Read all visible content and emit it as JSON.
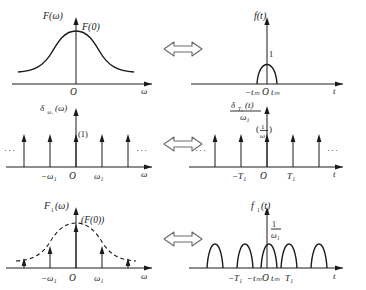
{
  "figure": {
    "relation_symbol": "double-headed-arrow",
    "line_color": "#1a1a1a",
    "background_color": "#ffffff"
  },
  "rows": [
    {
      "id": "row-transform-pair-1",
      "left": {
        "name": "spectrum-F-omega",
        "y_axis_label": "F(ω)",
        "x_axis_label": "ω",
        "origin_label": "O",
        "peak_label": "F(0)",
        "curve_type": "bell",
        "curve_style": "solid",
        "tick_labels": []
      },
      "right": {
        "name": "signal-f-t",
        "y_axis_label": "f(t)",
        "x_axis_label": "t",
        "origin_label": "O",
        "peak_label": "1",
        "curve_type": "single-pulse",
        "curve_style": "solid",
        "tick_labels": [
          "−t",
          "m",
          "t",
          "m"
        ],
        "tick_left": "−tₘ",
        "tick_right": "tₘ"
      }
    },
    {
      "id": "row-transform-pair-2",
      "left": {
        "name": "impulse-train-omega",
        "y_axis_label": "δ",
        "y_axis_sub": "ω₁",
        "y_axis_arg": "(ω)",
        "x_axis_label": "ω",
        "origin_label": "O",
        "center_weight_label": "(1)",
        "curve_type": "impulse-train",
        "tick_left": "−ω₁",
        "tick_right": "ω₁",
        "ellipsis": "···",
        "impulse_count": 5
      },
      "right": {
        "name": "impulse-train-time-scaled",
        "y_axis_numerator": "δ",
        "y_axis_numerator_sub": "T₁",
        "y_axis_numerator_arg": "(t)",
        "y_axis_denominator": "ω₁",
        "x_axis_label": "t",
        "origin_label": "O",
        "center_weight_label": "(1/ω₁)",
        "center_weight_num": "1",
        "center_weight_den": "ω₁",
        "curve_type": "impulse-train",
        "tick_left": "−T₁",
        "tick_right": "T₁",
        "ellipsis": "···",
        "impulse_count": 5
      }
    },
    {
      "id": "row-transform-pair-3",
      "left": {
        "name": "sampled-spectrum-F1-omega",
        "y_axis_label": "F",
        "y_axis_sub": "1",
        "y_axis_arg": "(ω)",
        "x_axis_label": "ω",
        "origin_label": "O",
        "peak_label": "(F(0))",
        "curve_type": "sampled-bell",
        "curve_style": "dashed-envelope",
        "tick_left": "−ω₁",
        "tick_right": "ω₁",
        "impulse_count": 5
      },
      "right": {
        "name": "periodic-signal-f1-t",
        "y_axis_label": "f",
        "y_axis_sub": "1",
        "y_axis_arg": "(t)",
        "x_axis_label": "t",
        "origin_label": "O",
        "amplitude_num": "1",
        "amplitude_den": "ω₁",
        "curve_type": "pulse-train",
        "curve_style": "solid",
        "tick_T_left": "−T₁",
        "tick_tm_left": "−tₘ",
        "tick_tm_right": "tₘ",
        "tick_T_right": "T₁",
        "pulse_count": 5
      }
    }
  ]
}
